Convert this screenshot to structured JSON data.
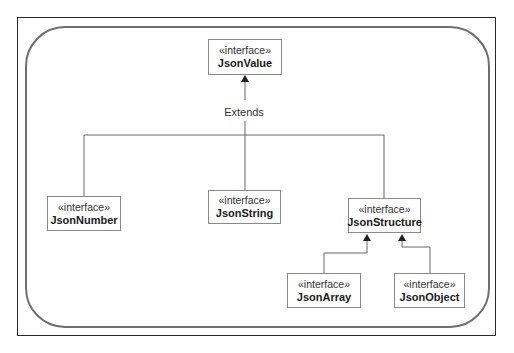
{
  "diagram": {
    "type": "uml-class-hierarchy",
    "relationship_label": "Extends",
    "nodes": {
      "json_value": {
        "stereotype": "«interface»",
        "name": "JsonValue"
      },
      "json_number": {
        "stereotype": "«interface»",
        "name": "JsonNumber"
      },
      "json_string": {
        "stereotype": "«interface»",
        "name": "JsonString"
      },
      "json_structure": {
        "stereotype": "«interface»",
        "name": "JsonStructure"
      },
      "json_array": {
        "stereotype": "«interface»",
        "name": "JsonArray"
      },
      "json_object": {
        "stereotype": "«interface»",
        "name": "JsonObject"
      }
    },
    "edges": [
      {
        "from": "JsonNumber",
        "to": "JsonValue",
        "kind": "extends"
      },
      {
        "from": "JsonString",
        "to": "JsonValue",
        "kind": "extends"
      },
      {
        "from": "JsonStructure",
        "to": "JsonValue",
        "kind": "extends"
      },
      {
        "from": "JsonArray",
        "to": "JsonStructure",
        "kind": "extends"
      },
      {
        "from": "JsonObject",
        "to": "JsonStructure",
        "kind": "extends"
      }
    ],
    "colors": {
      "line": "#666666",
      "box_border": "#8a8a8a",
      "frame": "#2a2a2a"
    }
  }
}
